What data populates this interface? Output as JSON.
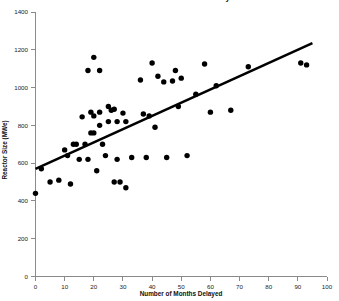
{
  "chart_data": {
    "type": "scatter",
    "title": "Reactor Size versus Months Delayed",
    "xlabel": "Number of Months Delayed",
    "ylabel": "Reactor Size (MWe)",
    "xlim": [
      0,
      100
    ],
    "ylim": [
      0,
      1400
    ],
    "xticks": [
      0,
      10,
      20,
      30,
      40,
      50,
      60,
      70,
      80,
      90,
      100
    ],
    "yticks": [
      0,
      200,
      400,
      600,
      800,
      1000,
      1200,
      1400
    ],
    "grid": false,
    "legend": null,
    "marker_color": "#000000",
    "trend_line_color": "#000000",
    "points": [
      {
        "x": 0,
        "y": 440
      },
      {
        "x": 2,
        "y": 570
      },
      {
        "x": 5,
        "y": 500
      },
      {
        "x": 8,
        "y": 510
      },
      {
        "x": 10,
        "y": 670
      },
      {
        "x": 11,
        "y": 640
      },
      {
        "x": 12,
        "y": 490
      },
      {
        "x": 13,
        "y": 700
      },
      {
        "x": 14,
        "y": 700
      },
      {
        "x": 15,
        "y": 620
      },
      {
        "x": 16,
        "y": 845
      },
      {
        "x": 17,
        "y": 700
      },
      {
        "x": 18,
        "y": 1090
      },
      {
        "x": 18,
        "y": 620
      },
      {
        "x": 19,
        "y": 870
      },
      {
        "x": 19,
        "y": 760
      },
      {
        "x": 20,
        "y": 1160
      },
      {
        "x": 20,
        "y": 850
      },
      {
        "x": 20,
        "y": 760
      },
      {
        "x": 21,
        "y": 560
      },
      {
        "x": 22,
        "y": 1090
      },
      {
        "x": 22,
        "y": 870
      },
      {
        "x": 22,
        "y": 800
      },
      {
        "x": 23,
        "y": 700
      },
      {
        "x": 24,
        "y": 640
      },
      {
        "x": 25,
        "y": 900
      },
      {
        "x": 25,
        "y": 820
      },
      {
        "x": 26,
        "y": 880
      },
      {
        "x": 27,
        "y": 885
      },
      {
        "x": 27,
        "y": 500
      },
      {
        "x": 28,
        "y": 820
      },
      {
        "x": 28,
        "y": 620
      },
      {
        "x": 29,
        "y": 500
      },
      {
        "x": 30,
        "y": 865
      },
      {
        "x": 31,
        "y": 820
      },
      {
        "x": 31,
        "y": 470
      },
      {
        "x": 33,
        "y": 630
      },
      {
        "x": 36,
        "y": 1040
      },
      {
        "x": 37,
        "y": 860
      },
      {
        "x": 38,
        "y": 630
      },
      {
        "x": 39,
        "y": 850
      },
      {
        "x": 40,
        "y": 1130
      },
      {
        "x": 41,
        "y": 790
      },
      {
        "x": 42,
        "y": 1060
      },
      {
        "x": 44,
        "y": 1030
      },
      {
        "x": 45,
        "y": 630
      },
      {
        "x": 47,
        "y": 1035
      },
      {
        "x": 48,
        "y": 1090
      },
      {
        "x": 49,
        "y": 900
      },
      {
        "x": 50,
        "y": 1050
      },
      {
        "x": 52,
        "y": 640
      },
      {
        "x": 55,
        "y": 965
      },
      {
        "x": 58,
        "y": 1125
      },
      {
        "x": 60,
        "y": 870
      },
      {
        "x": 62,
        "y": 1010
      },
      {
        "x": 67,
        "y": 880
      },
      {
        "x": 73,
        "y": 1110
      },
      {
        "x": 91,
        "y": 1130
      },
      {
        "x": 93,
        "y": 1120
      }
    ],
    "trend_line": {
      "x_start": 0,
      "y_start": 570,
      "x_end": 95,
      "y_end": 1235
    }
  }
}
